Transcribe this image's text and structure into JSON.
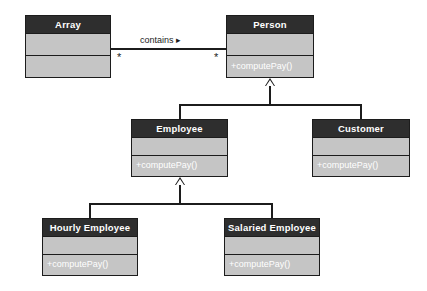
{
  "diagram": {
    "type": "uml-class-diagram",
    "classes": [
      {
        "id": "array",
        "name": "Array",
        "attributes": "",
        "methods": "",
        "x": 25,
        "y": 15,
        "width": 86,
        "height": 63,
        "compartments": 3
      },
      {
        "id": "person",
        "name": "Person",
        "attributes": "",
        "methods": "+computePay()",
        "x": 226,
        "y": 15,
        "width": 88,
        "height": 63,
        "compartments": 3
      },
      {
        "id": "employee",
        "name": "Employee",
        "attributes": "",
        "methods": "+computePay()",
        "x": 131,
        "y": 119,
        "width": 97,
        "height": 58,
        "compartments": 3
      },
      {
        "id": "customer",
        "name": "Customer",
        "attributes": "",
        "methods": "+computePay()",
        "x": 312,
        "y": 119,
        "width": 98,
        "height": 58,
        "compartments": 3
      },
      {
        "id": "hourly-employee",
        "name": "Hourly Employee",
        "attributes": "",
        "methods": "+computePay()",
        "x": 42,
        "y": 218,
        "width": 96,
        "height": 58,
        "compartments": 3
      },
      {
        "id": "salaried-employee",
        "name": "Salaried Employee",
        "attributes": "",
        "methods": "+computePay()",
        "x": 224,
        "y": 218,
        "width": 96,
        "height": 58,
        "compartments": 3
      }
    ],
    "associations": [
      {
        "id": "array-contains-person",
        "label": "contains ▸",
        "from": "array",
        "to": "person",
        "from_multiplicity": "*",
        "to_multiplicity": "*"
      }
    ],
    "generalizations": [
      {
        "id": "employee-to-person",
        "child": "employee",
        "parent": "person"
      },
      {
        "id": "customer-to-person",
        "child": "customer",
        "parent": "person"
      },
      {
        "id": "hourly-to-employee",
        "child": "hourly-employee",
        "parent": "employee"
      },
      {
        "id": "salaried-to-employee",
        "child": "salaried-employee",
        "parent": "employee"
      }
    ],
    "colors": {
      "header_fill": "#2e2e2e",
      "header_text": "#ffffff",
      "body_fill": "#c5c5c5",
      "border": "#1c1c1c",
      "line": "#1c1c1c",
      "background": "#ffffff",
      "method_text": "#ffffff"
    }
  }
}
